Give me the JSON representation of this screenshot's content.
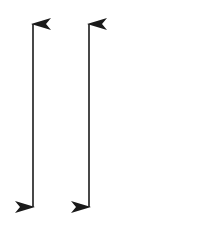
{
  "diagram": {
    "background": "#ffffff",
    "stroke_color": "#1a1a1a",
    "arrows": [
      {
        "name": "left-double-arrow",
        "x": 33,
        "y_top": 24,
        "y_bottom": 207,
        "direction": "bidirectional-vertical"
      },
      {
        "name": "right-double-arrow",
        "x": 89,
        "y_top": 24,
        "y_bottom": 207,
        "direction": "bidirectional-vertical"
      }
    ]
  }
}
